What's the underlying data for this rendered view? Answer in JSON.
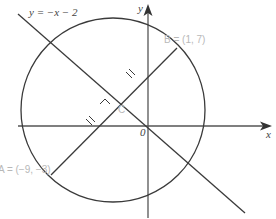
{
  "diagram": {
    "line_label": "y = −x − 2",
    "axis_x_label": "x",
    "axis_y_label": "y",
    "origin_label": "0",
    "point_a_label": "A = (−9, −3)",
    "point_b_label": "B = (1, 7)",
    "center_label": "C",
    "colors": {
      "stroke": "#3a3a3a",
      "axis": "#555555",
      "faint_label": "#b8b8b8"
    },
    "elements": {
      "circle": {
        "center": "C",
        "diameter_endpoints": [
          "A",
          "B"
        ]
      },
      "line": "y = -x - 2",
      "right_angle_at": "C",
      "equal_tick_marks": 2
    }
  }
}
